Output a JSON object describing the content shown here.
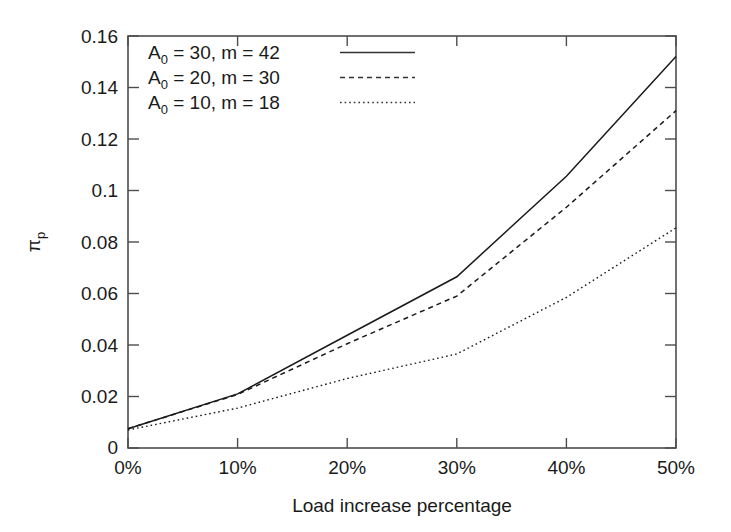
{
  "chart_data": {
    "type": "line",
    "title": "",
    "xlabel": "Load increase percentage",
    "ylabel": "π",
    "ylabel_sub": "p",
    "x": [
      0,
      10,
      20,
      30,
      40,
      50
    ],
    "xtick_labels": [
      "0%",
      "10%",
      "20%",
      "30%",
      "40%",
      "50%"
    ],
    "ytick_labels": [
      "0",
      "0.02",
      "0.04",
      "0.06",
      "0.08",
      "0.1",
      "0.12",
      "0.14",
      "0.16"
    ],
    "ytick_values": [
      0,
      0.02,
      0.04,
      0.06,
      0.08,
      0.1,
      0.12,
      0.14,
      0.16
    ],
    "xlim": [
      0,
      50
    ],
    "ylim": [
      0,
      0.16
    ],
    "grid": false,
    "legend_position": "top-left-inside",
    "series": [
      {
        "name": "A_0 = 30, m = 42",
        "label_prefix": "A",
        "label_sub": "0",
        "label_rest": " = 30, m = 42",
        "style": "solid",
        "color": "#1a1a1a",
        "values": [
          0.0075,
          0.021,
          0.0438,
          0.0665,
          0.1055,
          0.152
        ]
      },
      {
        "name": "A_0 = 20, m = 30",
        "label_prefix": "A",
        "label_sub": "0",
        "label_rest": " = 20, m = 30",
        "style": "dashed",
        "color": "#1a1a1a",
        "values": [
          0.0075,
          0.0208,
          0.0405,
          0.059,
          0.0935,
          0.131
        ]
      },
      {
        "name": "A_0 = 10, m = 18",
        "label_prefix": "A",
        "label_sub": "0",
        "label_rest": " = 10, m = 18",
        "style": "dotted",
        "color": "#1a1a1a",
        "values": [
          0.007,
          0.0155,
          0.027,
          0.0365,
          0.0585,
          0.0855
        ]
      }
    ]
  }
}
